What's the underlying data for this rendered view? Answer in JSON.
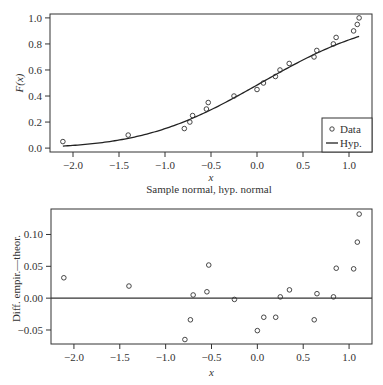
{
  "chart_data": [
    {
      "type": "scatter",
      "panel": "top",
      "title": "Sample normal, hyp. normal",
      "xlabel": "x",
      "ylabel": "F(x)",
      "xlim": [
        -2.25,
        1.25
      ],
      "ylim": [
        -0.03,
        1.03
      ],
      "xticks": [
        -2.0,
        -1.5,
        -1.0,
        -0.5,
        0.0,
        0.5,
        1.0
      ],
      "xtick_labels": [
        "−2.0",
        "−1.5",
        "−1.0",
        "−0.5",
        "0.0",
        "0.5",
        "1.0"
      ],
      "yticks": [
        0.0,
        0.2,
        0.4,
        0.6,
        0.8,
        1.0
      ],
      "ytick_labels": [
        "0.0",
        "0.2",
        "0.4",
        "0.6",
        "0.8",
        "1.0"
      ],
      "grid": false,
      "legend": {
        "position": "lower right",
        "entries": [
          {
            "label": "Data",
            "marker": "open-circle"
          },
          {
            "label": "Hyp.",
            "marker": "line"
          }
        ]
      },
      "series": [
        {
          "name": "Data",
          "kind": "points",
          "x": [
            -2.11,
            -1.4,
            -0.79,
            -0.73,
            -0.7,
            -0.55,
            -0.53,
            -0.25,
            0.0,
            0.07,
            0.2,
            0.25,
            0.35,
            0.62,
            0.65,
            0.83,
            0.86,
            1.05,
            1.09,
            1.11
          ],
          "y": [
            0.05,
            0.1,
            0.15,
            0.2,
            0.25,
            0.3,
            0.35,
            0.4,
            0.45,
            0.5,
            0.55,
            0.6,
            0.65,
            0.7,
            0.75,
            0.8,
            0.85,
            0.9,
            0.95,
            1.0
          ]
        },
        {
          "name": "Hyp.",
          "kind": "normal-cdf-line",
          "mean": 0.04,
          "sd": 1.0,
          "x_range": [
            -2.11,
            1.11
          ]
        }
      ]
    },
    {
      "type": "scatter",
      "panel": "bottom",
      "title": "",
      "xlabel": "x",
      "ylabel": "Diff. empir.—theor.",
      "xlim": [
        -2.25,
        1.25
      ],
      "ylim": [
        -0.072,
        0.14
      ],
      "xticks": [
        -2.0,
        -1.5,
        -1.0,
        -0.5,
        0.0,
        0.5,
        1.0
      ],
      "xtick_labels": [
        "−2.0",
        "−1.5",
        "−1.0",
        "−0.5",
        "0.0",
        "0.5",
        "1.0"
      ],
      "yticks": [
        -0.05,
        0.0,
        0.05,
        0.1
      ],
      "ytick_labels": [
        "−0.05",
        "0.00",
        "0.05",
        "0.10"
      ],
      "grid": false,
      "hline": 0.0,
      "series": [
        {
          "name": "Difference",
          "kind": "points",
          "x": [
            -2.11,
            -1.4,
            -0.79,
            -0.73,
            -0.7,
            -0.55,
            -0.53,
            -0.25,
            0.0,
            0.07,
            0.2,
            0.25,
            0.35,
            0.62,
            0.65,
            0.83,
            0.86,
            1.05,
            1.09,
            1.11
          ],
          "y": [
            0.032,
            0.019,
            -0.065,
            -0.034,
            0.005,
            0.01,
            0.052,
            -0.002,
            -0.051,
            -0.03,
            -0.03,
            0.002,
            0.013,
            -0.034,
            0.007,
            0.002,
            0.047,
            0.046,
            0.088,
            0.132
          ]
        }
      ]
    }
  ],
  "colors": {
    "axis": "#333333",
    "marker": "#333333",
    "line": "#222222",
    "background": "#ffffff"
  }
}
